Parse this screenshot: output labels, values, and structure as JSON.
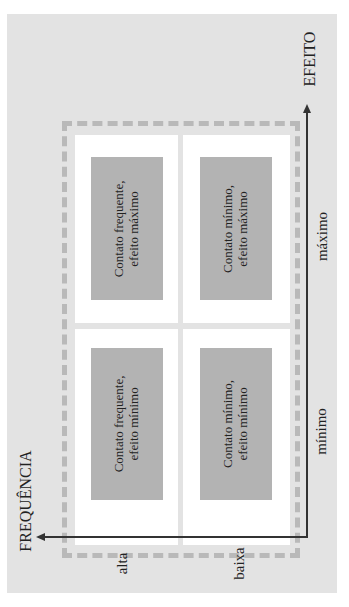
{
  "axes": {
    "x_axis": {
      "title": "EFEITO",
      "low": "mínimo",
      "high": "máximo"
    },
    "y_axis": {
      "title": "FREQUÊNCIA",
      "high": "alta",
      "low": "baixa"
    }
  },
  "quadrants": [
    {
      "position": "frequency-high-effect-max",
      "line1": "Contato frequente,",
      "line2": "efeito máximo"
    },
    {
      "position": "frequency-low-effect-max",
      "line1": "Contato mínimo,",
      "line2": "efeito máximo"
    },
    {
      "position": "frequency-high-effect-min",
      "line1": "Contato frequente,",
      "line2": "efeito mínimo"
    },
    {
      "position": "frequency-low-effect-min",
      "line1": "Contato mínimo,",
      "line2": "efeito mínimo"
    }
  ],
  "colors": {
    "panel": "#e3e3e3",
    "box": "#b3b3b3",
    "dashed": "#b9b9b9",
    "axis": "#333333"
  }
}
